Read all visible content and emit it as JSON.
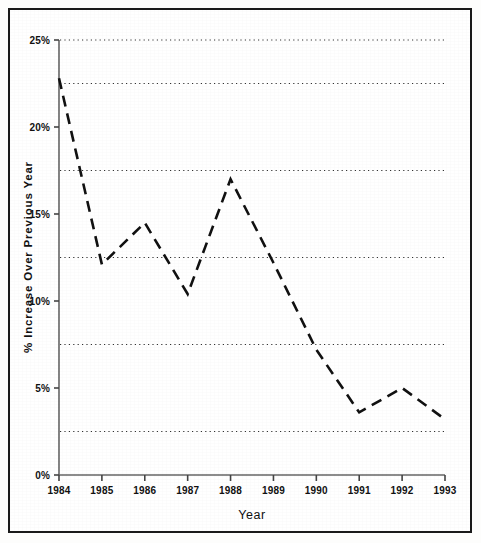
{
  "chart_data": {
    "type": "line",
    "title": "",
    "subtitle": "",
    "xlabel": "Year",
    "ylabel": "% Increase Over Previous Year",
    "x": [
      1984,
      1985,
      1986,
      1987,
      1988,
      1989,
      1990,
      1991,
      1992,
      1993
    ],
    "xticklabels": [
      "1984",
      "1985",
      "1986",
      "1987",
      "1988",
      "1989",
      "1990",
      "1991",
      "1992",
      "1993"
    ],
    "values": [
      22.8,
      12.1,
      14.5,
      10.4,
      17.0,
      12.2,
      7.2,
      3.6,
      5.0,
      3.2
    ],
    "yticklabels": [
      "0%",
      "5%",
      "10%",
      "15%",
      "20%",
      "25%"
    ],
    "yticks": [
      0,
      5,
      10,
      15,
      20,
      25
    ],
    "ylim": [
      0,
      25
    ],
    "xlim": [
      1984,
      1993
    ],
    "gridlines_y": [
      2.5,
      7.5,
      12.5,
      17.5,
      22.5,
      25
    ],
    "grid": "horizontal-dotted",
    "legend": "none",
    "line_style": "dashed",
    "line_color": "#111111",
    "marker": "none",
    "series": [
      {
        "name": "% Increase Over Previous Year",
        "values": [
          22.8,
          12.1,
          14.5,
          10.4,
          17.0,
          12.2,
          7.2,
          3.6,
          5.0,
          3.2
        ]
      }
    ]
  },
  "colors": {
    "line": "#111111",
    "axis": "#555555",
    "grid": "#333333",
    "frame": "#1a1a1a",
    "background": "#ffffff"
  }
}
